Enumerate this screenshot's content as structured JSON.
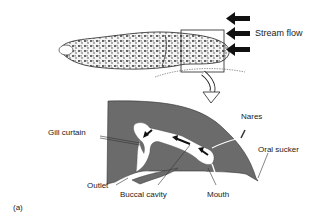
{
  "figure": {
    "panel_label": "(a)",
    "top_view": {
      "stream_flow_label": "Stream flow",
      "arrow_count": 3
    },
    "cross_section": {
      "labels": {
        "gill_curtain": "Gill curtain",
        "nares": "Nares",
        "oral_sucker": "Oral sucker",
        "outlet": "Outlet",
        "buccal_cavity": "Buccal cavity",
        "mouth": "Mouth"
      }
    },
    "colors": {
      "tissue": "#6b6b6b",
      "outline": "#222222",
      "background": "#ffffff"
    }
  }
}
